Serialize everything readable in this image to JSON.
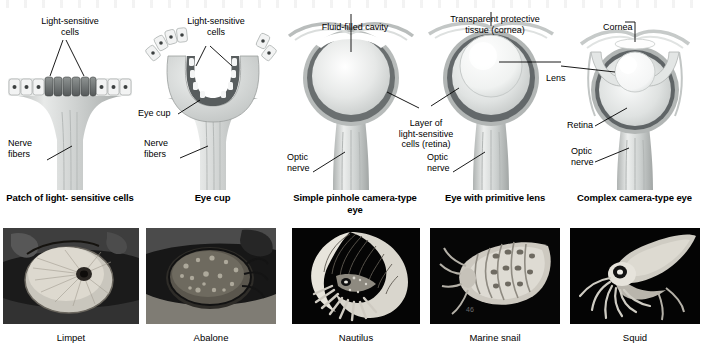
{
  "figure": {
    "background": "#ffffff",
    "stages": [
      {
        "id": "patch",
        "caption": "Patch of light-\nsensitive cells",
        "labels": [
          {
            "name": "light-sensitive-cells",
            "text": "Light-sensitive\ncells"
          },
          {
            "name": "nerve-fibers",
            "text": "Nerve\nfibers"
          }
        ],
        "animal": "Limpet"
      },
      {
        "id": "eye-cup",
        "caption": "Eye cup",
        "labels": [
          {
            "name": "light-sensitive-cells",
            "text": "Light-sensitive\ncells"
          },
          {
            "name": "eye-cup",
            "text": "Eye cup"
          },
          {
            "name": "nerve-fibers",
            "text": "Nerve\nfibers"
          }
        ],
        "animal": "Abalone"
      },
      {
        "id": "pinhole",
        "caption": "Simple pinhole\ncamera-type eye",
        "labels": [
          {
            "name": "fluid-filled-cavity",
            "text": "Fluid-filled cavity"
          },
          {
            "name": "optic-nerve",
            "text": "Optic\nnerve"
          }
        ],
        "animal": "Nautilus"
      },
      {
        "id": "primitive-lens",
        "caption": "Eye with\nprimitive lens",
        "labels": [
          {
            "name": "cornea",
            "text": "Transparent protective\ntissue (cornea)"
          },
          {
            "name": "retina-layer",
            "text": "Layer of\nlight-sensitive\ncells (retina)"
          },
          {
            "name": "lens",
            "text": "Lens"
          },
          {
            "name": "optic-nerve",
            "text": "Optic\nnerve"
          }
        ],
        "animal": "Marine snail"
      },
      {
        "id": "complex",
        "caption": "Complex\ncamera-type eye",
        "labels": [
          {
            "name": "cornea",
            "text": "Cornea"
          },
          {
            "name": "retina",
            "text": "Retina"
          },
          {
            "name": "optic-nerve",
            "text": "Optic\nnerve"
          }
        ],
        "animal": "Squid"
      }
    ],
    "photo_captions": [
      "Limpet",
      "Abalone",
      "Nautilus",
      "Marine snail",
      "Squid"
    ]
  }
}
